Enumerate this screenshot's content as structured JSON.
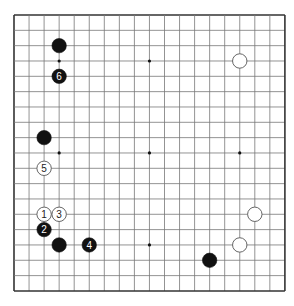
{
  "board": {
    "size": 19,
    "origin_x": 14,
    "origin_y": 15,
    "spacing_x": 15.05,
    "spacing_y": 15.33,
    "line_color": "#777777",
    "border_color": "#333333",
    "star_points": [
      [
        3,
        3
      ],
      [
        9,
        3
      ],
      [
        15,
        3
      ],
      [
        3,
        9
      ],
      [
        9,
        9
      ],
      [
        15,
        9
      ],
      [
        3,
        15
      ],
      [
        9,
        15
      ],
      [
        15,
        15
      ]
    ],
    "visible_star_points": [
      [
        3,
        3
      ],
      [
        9,
        3
      ],
      [
        3,
        9
      ],
      [
        9,
        9
      ],
      [
        15,
        9
      ],
      [
        9,
        15
      ]
    ]
  },
  "stones": [
    {
      "color": "black",
      "col": 3,
      "row": 2,
      "label": ""
    },
    {
      "color": "black",
      "col": 3,
      "row": 4,
      "label": "6"
    },
    {
      "color": "white",
      "col": 15,
      "row": 3,
      "label": ""
    },
    {
      "color": "black",
      "col": 2,
      "row": 8,
      "label": ""
    },
    {
      "color": "white",
      "col": 2,
      "row": 10,
      "label": "5"
    },
    {
      "color": "white",
      "col": 2,
      "row": 13,
      "label": "1"
    },
    {
      "color": "white",
      "col": 3,
      "row": 13,
      "label": "3"
    },
    {
      "color": "black",
      "col": 2,
      "row": 14,
      "label": "2"
    },
    {
      "color": "black",
      "col": 3,
      "row": 15,
      "label": ""
    },
    {
      "color": "black",
      "col": 5,
      "row": 15,
      "label": "4"
    },
    {
      "color": "white",
      "col": 16,
      "row": 13,
      "label": ""
    },
    {
      "color": "white",
      "col": 15,
      "row": 15,
      "label": ""
    },
    {
      "color": "black",
      "col": 13,
      "row": 16,
      "label": ""
    }
  ]
}
